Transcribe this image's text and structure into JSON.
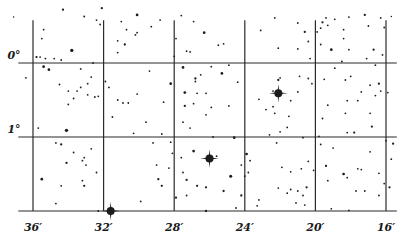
{
  "chart_data": {
    "type": "scatter",
    "title": "",
    "xlabel": "",
    "ylabel": "",
    "x_axis": {
      "quantity": "right ascension (minutes)",
      "range": [
        37.4,
        15.5
      ],
      "ticks": [
        36,
        32,
        28,
        24,
        20,
        16
      ],
      "tick_labels": [
        "36′",
        "32′",
        "28′",
        "24′",
        "20′",
        "16′"
      ]
    },
    "y_axis": {
      "quantity": "declination (degrees)",
      "range": [
        -0.74,
        2.0
      ],
      "ticks": [
        0,
        1
      ],
      "tick_labels": [
        "0°",
        "1°"
      ],
      "lower_edge": 2.0
    },
    "grid": true,
    "legend": "none",
    "bright_stars": [
      {
        "ra": 31.6,
        "dec": 2.0,
        "size": 4
      },
      {
        "ra": 26.0,
        "dec": 1.29,
        "size": 4
      },
      {
        "ra": 22.1,
        "dec": 0.41,
        "size": 4
      }
    ],
    "stars": [
      {
        "ra": 37.1,
        "dec": -0.62,
        "size": 1
      },
      {
        "ra": 34.3,
        "dec": -0.72,
        "size": 1.5
      },
      {
        "ra": 33.1,
        "dec": -0.63,
        "size": 1.3
      },
      {
        "ra": 32.1,
        "dec": -0.74,
        "size": 1.5
      },
      {
        "ra": 32.4,
        "dec": -0.58,
        "size": 1.2
      },
      {
        "ra": 32.2,
        "dec": -0.52,
        "size": 1.2
      },
      {
        "ra": 35.4,
        "dec": -0.45,
        "size": 1.2
      },
      {
        "ra": 35.5,
        "dec": -0.33,
        "size": 1.2
      },
      {
        "ra": 33.8,
        "dec": -0.17,
        "size": 2.2
      },
      {
        "ra": 35.8,
        "dec": -0.08,
        "size": 1.5
      },
      {
        "ra": 35.6,
        "dec": -0.08,
        "size": 1.2
      },
      {
        "ra": 35.3,
        "dec": -0.06,
        "size": 1.2
      },
      {
        "ra": 34.8,
        "dec": -0.06,
        "size": 1.2
      },
      {
        "ra": 34.4,
        "dec": -0.04,
        "size": 1.2
      },
      {
        "ra": 35.4,
        "dec": 0.05,
        "size": 1.8
      },
      {
        "ra": 35.1,
        "dec": 0.09,
        "size": 1.8
      },
      {
        "ra": 36.4,
        "dec": 0.2,
        "size": 1.2
      },
      {
        "ra": 34.5,
        "dec": 0.29,
        "size": 1.2
      },
      {
        "ra": 34.0,
        "dec": 0.38,
        "size": 1.2
      },
      {
        "ra": 33.5,
        "dec": 0.38,
        "size": 1.2
      },
      {
        "ra": 33.3,
        "dec": 0.33,
        "size": 1.2
      },
      {
        "ra": 32.7,
        "dec": 0.19,
        "size": 1.2
      },
      {
        "ra": 32.9,
        "dec": 0.28,
        "size": 1.2
      },
      {
        "ra": 32.9,
        "dec": 0.43,
        "size": 1.2
      },
      {
        "ra": 32.3,
        "dec": 0.45,
        "size": 1.2
      },
      {
        "ra": 33.7,
        "dec": 0.48,
        "size": 1.2
      },
      {
        "ra": 32.5,
        "dec": 0.46,
        "size": 1.2
      },
      {
        "ra": 34.0,
        "dec": 0.56,
        "size": 1.2
      },
      {
        "ra": 33.3,
        "dec": 0.08,
        "size": 1.2
      },
      {
        "ra": 32.6,
        "dec": 0.0,
        "size": 1.2
      },
      {
        "ra": 34.4,
        "dec": 1.1,
        "size": 1.5
      },
      {
        "ra": 35.7,
        "dec": 0.88,
        "size": 1.2
      },
      {
        "ra": 34.1,
        "dec": 0.91,
        "size": 2.2
      },
      {
        "ra": 34.7,
        "dec": 1.08,
        "size": 1.2
      },
      {
        "ra": 33.7,
        "dec": 1.21,
        "size": 1.2
      },
      {
        "ra": 33.1,
        "dec": 1.28,
        "size": 1.2
      },
      {
        "ra": 33.2,
        "dec": 1.32,
        "size": 1.2
      },
      {
        "ra": 33.0,
        "dec": 1.38,
        "size": 1.2
      },
      {
        "ra": 34.1,
        "dec": 1.35,
        "size": 1.5
      },
      {
        "ra": 32.7,
        "dec": 1.16,
        "size": 1.2
      },
      {
        "ra": 32.4,
        "dec": 1.48,
        "size": 1.2
      },
      {
        "ra": 33.2,
        "dec": 1.59,
        "size": 1.2
      },
      {
        "ra": 33.1,
        "dec": 1.66,
        "size": 1.5
      },
      {
        "ra": 35.5,
        "dec": 1.57,
        "size": 1.8
      },
      {
        "ra": 34.4,
        "dec": 1.66,
        "size": 1.2
      },
      {
        "ra": 34.7,
        "dec": 1.9,
        "size": 1.2
      },
      {
        "ra": 32.3,
        "dec": 2.0,
        "size": 1.2
      },
      {
        "ra": 31.2,
        "dec": -0.14,
        "size": 1.2
      },
      {
        "ra": 30.1,
        "dec": -0.65,
        "size": 1.8
      },
      {
        "ra": 30.2,
        "dec": -0.38,
        "size": 1.2
      },
      {
        "ra": 31.0,
        "dec": -0.56,
        "size": 1.2
      },
      {
        "ra": 30.7,
        "dec": -0.45,
        "size": 1.2
      },
      {
        "ra": 30.1,
        "dec": -0.41,
        "size": 1.2
      },
      {
        "ra": 31.2,
        "dec": -0.3,
        "size": 1.2
      },
      {
        "ra": 30.8,
        "dec": -0.25,
        "size": 1.5
      },
      {
        "ra": 31.9,
        "dec": 0.25,
        "size": 1.2
      },
      {
        "ra": 31.7,
        "dec": 0.33,
        "size": 1.2
      },
      {
        "ra": 30.1,
        "dec": 0.42,
        "size": 1.2
      },
      {
        "ra": 31.2,
        "dec": 0.5,
        "size": 1.2
      },
      {
        "ra": 30.9,
        "dec": 0.54,
        "size": 1.2
      },
      {
        "ra": 30.6,
        "dec": 0.54,
        "size": 1.2
      },
      {
        "ra": 28.6,
        "dec": 0.53,
        "size": 1.2
      },
      {
        "ra": 29.4,
        "dec": 0.11,
        "size": 1.2
      },
      {
        "ra": 31.5,
        "dec": 0.73,
        "size": 1.2
      },
      {
        "ra": 29.6,
        "dec": 0.8,
        "size": 1.2
      },
      {
        "ra": 30.3,
        "dec": 0.95,
        "size": 1.2
      },
      {
        "ra": 29.3,
        "dec": -0.49,
        "size": 1.2
      },
      {
        "ra": 28.8,
        "dec": -0.58,
        "size": 1.2
      },
      {
        "ra": 27.6,
        "dec": -0.64,
        "size": 1.2
      },
      {
        "ra": 26.9,
        "dec": -0.56,
        "size": 1.2
      },
      {
        "ra": 27.9,
        "dec": -0.33,
        "size": 1.2
      },
      {
        "ra": 26.3,
        "dec": -0.41,
        "size": 1.8
      },
      {
        "ra": 28.0,
        "dec": -0.09,
        "size": 1.2
      },
      {
        "ra": 27.3,
        "dec": -0.16,
        "size": 1.2
      },
      {
        "ra": 27.1,
        "dec": -0.15,
        "size": 1.2
      },
      {
        "ra": 25.5,
        "dec": -0.24,
        "size": 1.2
      },
      {
        "ra": 25.2,
        "dec": -0.26,
        "size": 1.2
      },
      {
        "ra": 25.9,
        "dec": 0.05,
        "size": 1.2
      },
      {
        "ra": 24.9,
        "dec": 0.03,
        "size": 1.2
      },
      {
        "ra": 27.5,
        "dec": 0.06,
        "size": 1.8
      },
      {
        "ra": 26.5,
        "dec": 0.16,
        "size": 1.2
      },
      {
        "ra": 25.3,
        "dec": 0.14,
        "size": 1.8
      },
      {
        "ra": 26.8,
        "dec": 0.21,
        "size": 1.5
      },
      {
        "ra": 26.8,
        "dec": 0.25,
        "size": 1.2
      },
      {
        "ra": 28.2,
        "dec": 0.28,
        "size": 1.8
      },
      {
        "ra": 24.4,
        "dec": 0.26,
        "size": 1.2
      },
      {
        "ra": 27.4,
        "dec": 0.4,
        "size": 1.8
      },
      {
        "ra": 26.7,
        "dec": 0.41,
        "size": 1.2
      },
      {
        "ra": 26.2,
        "dec": 0.41,
        "size": 1.2
      },
      {
        "ra": 26.9,
        "dec": 0.55,
        "size": 1.2
      },
      {
        "ra": 27.4,
        "dec": 0.58,
        "size": 1.5
      },
      {
        "ra": 25.9,
        "dec": 0.6,
        "size": 1.2
      },
      {
        "ra": 24.9,
        "dec": 0.58,
        "size": 1.2
      },
      {
        "ra": 22.4,
        "dec": 0.59,
        "size": 1.2
      },
      {
        "ra": 23.2,
        "dec": 0.49,
        "size": 1.2
      },
      {
        "ra": 26.2,
        "dec": 0.7,
        "size": 1.2
      },
      {
        "ra": 27.1,
        "dec": 0.88,
        "size": 1.2
      },
      {
        "ra": 25.8,
        "dec": 1.0,
        "size": 1.2
      },
      {
        "ra": 24.6,
        "dec": 1.01,
        "size": 1.8
      },
      {
        "ra": 23.9,
        "dec": 1.23,
        "size": 1.8
      },
      {
        "ra": 23.7,
        "dec": 1.32,
        "size": 1.2
      },
      {
        "ra": 28.1,
        "dec": 1.22,
        "size": 1.2
      },
      {
        "ra": 28.9,
        "dec": 1.57,
        "size": 1.5
      },
      {
        "ra": 27.6,
        "dec": 1.28,
        "size": 1.2
      },
      {
        "ra": 29.0,
        "dec": 1.38,
        "size": 1.2
      },
      {
        "ra": 28.3,
        "dec": 1.42,
        "size": 1.2
      },
      {
        "ra": 28.7,
        "dec": 1.66,
        "size": 1.5
      },
      {
        "ra": 27.5,
        "dec": 1.48,
        "size": 1.2
      },
      {
        "ra": 27.3,
        "dec": 1.58,
        "size": 1.5
      },
      {
        "ra": 26.7,
        "dec": 1.66,
        "size": 1.5
      },
      {
        "ra": 26.2,
        "dec": 1.68,
        "size": 1.5
      },
      {
        "ra": 27.3,
        "dec": 1.79,
        "size": 1.2
      },
      {
        "ra": 29.9,
        "dec": 1.87,
        "size": 1.2
      },
      {
        "ra": 27.9,
        "dec": 1.82,
        "size": 1.5
      },
      {
        "ra": 26.2,
        "dec": 2.0,
        "size": 1.5
      },
      {
        "ra": 28.7,
        "dec": 0.96,
        "size": 1.2
      },
      {
        "ra": 28.2,
        "dec": 1.07,
        "size": 1.2
      },
      {
        "ra": 29.2,
        "dec": 1.08,
        "size": 1.2
      },
      {
        "ra": 26.9,
        "dec": 1.19,
        "size": 1.8
      },
      {
        "ra": 27.5,
        "dec": 0.8,
        "size": 1.2
      },
      {
        "ra": 25.6,
        "dec": 1.26,
        "size": 1.2
      },
      {
        "ra": 24.2,
        "dec": 1.38,
        "size": 1.2
      },
      {
        "ra": 24.8,
        "dec": 1.53,
        "size": 2.0
      },
      {
        "ra": 23.8,
        "dec": 1.48,
        "size": 1.2
      },
      {
        "ra": 24.0,
        "dec": 1.53,
        "size": 1.2
      },
      {
        "ra": 25.2,
        "dec": 1.73,
        "size": 1.5
      },
      {
        "ra": 24.2,
        "dec": 1.79,
        "size": 1.5
      },
      {
        "ra": 23.2,
        "dec": 1.85,
        "size": 1.2
      },
      {
        "ra": 24.5,
        "dec": 1.96,
        "size": 1.2
      },
      {
        "ra": 23.3,
        "dec": 1.93,
        "size": 1.2
      },
      {
        "ra": 22.6,
        "dec": 0.97,
        "size": 1.2
      },
      {
        "ra": 22.3,
        "dec": 0.68,
        "size": 1.2
      },
      {
        "ra": 22.0,
        "dec": 0.93,
        "size": 1.2
      },
      {
        "ra": 21.9,
        "dec": 1.41,
        "size": 1.2
      },
      {
        "ra": 22.2,
        "dec": 1.08,
        "size": 1.2
      },
      {
        "ra": 21.6,
        "dec": 0.87,
        "size": 1.2
      },
      {
        "ra": 23.1,
        "dec": -0.44,
        "size": 1.2
      },
      {
        "ra": 22.3,
        "dec": -0.61,
        "size": 1.2
      },
      {
        "ra": 22.1,
        "dec": -0.2,
        "size": 1.2
      },
      {
        "ra": 22.1,
        "dec": 0.23,
        "size": 1.5
      },
      {
        "ra": 22.4,
        "dec": 0.38,
        "size": 1.2
      },
      {
        "ra": 22.0,
        "dec": 0.2,
        "size": 1.2
      },
      {
        "ra": 21.4,
        "dec": 0.51,
        "size": 1.2
      },
      {
        "ra": 22.8,
        "dec": 0.63,
        "size": 1.2
      },
      {
        "ra": 21.5,
        "dec": 0.72,
        "size": 1.2
      },
      {
        "ra": 21.0,
        "dec": -0.54,
        "size": 1.2
      },
      {
        "ra": 20.6,
        "dec": -0.42,
        "size": 1.5
      },
      {
        "ra": 20.4,
        "dec": -0.29,
        "size": 1.2
      },
      {
        "ra": 21.0,
        "dec": -0.19,
        "size": 1.2
      },
      {
        "ra": 20.3,
        "dec": -0.06,
        "size": 1.2
      },
      {
        "ra": 20.9,
        "dec": 0.18,
        "size": 1.2
      },
      {
        "ra": 20.4,
        "dec": 0.21,
        "size": 1.2
      },
      {
        "ra": 21.0,
        "dec": 0.39,
        "size": 1.2
      },
      {
        "ra": 20.2,
        "dec": 0.28,
        "size": 1.2
      },
      {
        "ra": 20.7,
        "dec": 1.01,
        "size": 1.2
      },
      {
        "ra": 20.4,
        "dec": 1.33,
        "size": 1.2
      },
      {
        "ra": 20.1,
        "dec": 1.45,
        "size": 1.2
      },
      {
        "ra": 20.8,
        "dec": 1.43,
        "size": 1.2
      },
      {
        "ra": 21.4,
        "dec": 1.47,
        "size": 1.2
      },
      {
        "ra": 21.0,
        "dec": 1.73,
        "size": 1.2
      },
      {
        "ra": 21.4,
        "dec": 1.71,
        "size": 1.2
      },
      {
        "ra": 20.5,
        "dec": 1.68,
        "size": 1.5
      },
      {
        "ra": 22.1,
        "dec": 1.69,
        "size": 1.2
      },
      {
        "ra": 21.1,
        "dec": 1.89,
        "size": 1.2
      },
      {
        "ra": 20.7,
        "dec": 1.79,
        "size": 1.2
      },
      {
        "ra": 21.6,
        "dec": 1.76,
        "size": 1.2
      },
      {
        "ra": 20.6,
        "dec": 1.92,
        "size": 1.2
      },
      {
        "ra": 19.4,
        "dec": -0.61,
        "size": 1.2
      },
      {
        "ra": 19.6,
        "dec": -0.55,
        "size": 1.5
      },
      {
        "ra": 19.9,
        "dec": -0.42,
        "size": 1.2
      },
      {
        "ra": 19.7,
        "dec": -0.47,
        "size": 1.2
      },
      {
        "ra": 19.3,
        "dec": -0.51,
        "size": 1.2
      },
      {
        "ra": 18.9,
        "dec": -0.59,
        "size": 1.2
      },
      {
        "ra": 18.4,
        "dec": -0.45,
        "size": 1.2
      },
      {
        "ra": 18.1,
        "dec": -0.62,
        "size": 1.2
      },
      {
        "ra": 17.2,
        "dec": -0.65,
        "size": 1.5
      },
      {
        "ra": 16.1,
        "dec": -0.48,
        "size": 1.2
      },
      {
        "ra": 16.3,
        "dec": -0.61,
        "size": 1.2
      },
      {
        "ra": 19.1,
        "dec": -0.18,
        "size": 1.8
      },
      {
        "ra": 19.7,
        "dec": -0.25,
        "size": 1.2
      },
      {
        "ra": 18.4,
        "dec": -0.33,
        "size": 1.2
      },
      {
        "ra": 18.1,
        "dec": -0.18,
        "size": 1.2
      },
      {
        "ra": 18.5,
        "dec": -0.02,
        "size": 1.2
      },
      {
        "ra": 17.1,
        "dec": -0.06,
        "size": 1.2
      },
      {
        "ra": 16.2,
        "dec": -0.11,
        "size": 1.2
      },
      {
        "ra": 17.0,
        "dec": -0.5,
        "size": 1.2
      },
      {
        "ra": 18.9,
        "dec": 0.07,
        "size": 1.2
      },
      {
        "ra": 16.6,
        "dec": 0.03,
        "size": 1.2
      },
      {
        "ra": 18.0,
        "dec": 0.18,
        "size": 1.2
      },
      {
        "ra": 18.3,
        "dec": 0.23,
        "size": 1.2
      },
      {
        "ra": 19.5,
        "dec": 0.22,
        "size": 1.2
      },
      {
        "ra": 17.4,
        "dec": 0.39,
        "size": 1.2
      },
      {
        "ra": 16.6,
        "dec": 0.44,
        "size": 1.2
      },
      {
        "ra": 17.6,
        "dec": 0.51,
        "size": 1.2
      },
      {
        "ra": 18.2,
        "dec": 0.51,
        "size": 1.2
      },
      {
        "ra": 16.3,
        "dec": 0.38,
        "size": 1.2
      },
      {
        "ra": 16.9,
        "dec": 0.3,
        "size": 1.2
      },
      {
        "ra": 19.3,
        "dec": 0.57,
        "size": 1.2
      },
      {
        "ra": 18.3,
        "dec": 0.68,
        "size": 1.2
      },
      {
        "ra": 15.9,
        "dec": 0.4,
        "size": 1.2
      },
      {
        "ra": 16.7,
        "dec": -0.18,
        "size": 1.5
      },
      {
        "ra": 16.4,
        "dec": 0.28,
        "size": 1.5
      },
      {
        "ra": 16.9,
        "dec": 0.68,
        "size": 1.2
      },
      {
        "ra": 17.8,
        "dec": 0.94,
        "size": 1.5
      },
      {
        "ra": 18.2,
        "dec": 0.94,
        "size": 1.2
      },
      {
        "ra": 19.6,
        "dec": 0.75,
        "size": 1.2
      },
      {
        "ra": 16.4,
        "dec": 1.49,
        "size": 1.2
      },
      {
        "ra": 19.8,
        "dec": 0.99,
        "size": 1.2
      },
      {
        "ra": 19.4,
        "dec": 1.39,
        "size": 1.5
      },
      {
        "ra": 19.7,
        "dec": 1.1,
        "size": 1.2
      },
      {
        "ra": 19.3,
        "dec": 1.59,
        "size": 1.2
      },
      {
        "ra": 18.2,
        "dec": 1.55,
        "size": 1.2
      },
      {
        "ra": 17.6,
        "dec": 1.43,
        "size": 1.2
      },
      {
        "ra": 17.4,
        "dec": 1.44,
        "size": 1.2
      },
      {
        "ra": 16.1,
        "dec": 1.63,
        "size": 1.2
      },
      {
        "ra": 17.7,
        "dec": 1.73,
        "size": 1.2
      },
      {
        "ra": 19.1,
        "dec": 1.97,
        "size": 1.2
      },
      {
        "ra": 18.1,
        "dec": 1.99,
        "size": 1.2
      },
      {
        "ra": 19.0,
        "dec": 1.15,
        "size": 1.2
      },
      {
        "ra": 18.4,
        "dec": 1.5,
        "size": 1.8
      },
      {
        "ra": 16.8,
        "dec": 0.86,
        "size": 1.5
      },
      {
        "ra": 15.6,
        "dec": 1.09,
        "size": 1.5
      },
      {
        "ra": 15.7,
        "dec": 1.3,
        "size": 1.2
      },
      {
        "ra": 15.8,
        "dec": 1.68,
        "size": 1.5
      },
      {
        "ra": 16.4,
        "dec": 1.79,
        "size": 1.2
      },
      {
        "ra": 16.0,
        "dec": 1.05,
        "size": 1.2
      },
      {
        "ra": 16.9,
        "dec": 1.2,
        "size": 1.2
      },
      {
        "ra": 17.2,
        "dec": 1.73,
        "size": 1.2
      },
      {
        "ra": 15.7,
        "dec": -0.63,
        "size": 1.0
      }
    ]
  }
}
